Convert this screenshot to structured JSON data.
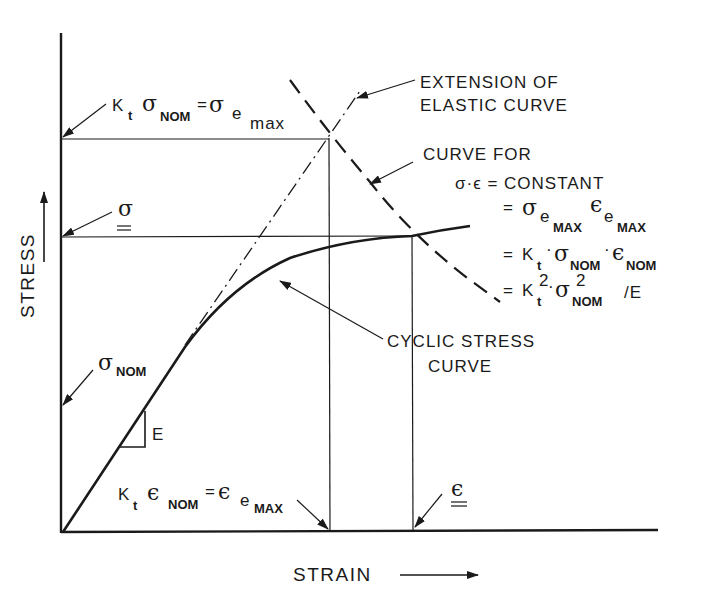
{
  "diagram": {
    "axes": {
      "x_label": "STRAIN",
      "y_label": "STRESS"
    },
    "labels": {
      "extension_line1": "EXTENSION OF",
      "extension_line2": "ELASTIC CURVE",
      "curve_for": "CURVE FOR",
      "eq1": "σ·ϵ = CONSTANT",
      "eq2_eq": "=",
      "eq3_eq": "=",
      "eq4_eq": "=",
      "cyclic_line1": "CYCLIC STRESS",
      "cyclic_line2": "CURVE",
      "slope_label": "E",
      "sigma_nom": "σ",
      "sigma_nom_sub": "NOM",
      "sigma_bar": "σ",
      "eps_bar": "ϵ",
      "kt_sigma_left": "K",
      "kt_sigma_t": "t",
      "kt_sigma_sig": "σ",
      "kt_sigma_nom": "NOM",
      "kt_sigma_eq": "=",
      "kt_sigma_rhs": "σ",
      "kt_sigma_e": "e",
      "kt_sigma_max": "max",
      "kt_eps_k": "K",
      "kt_eps_t": "t",
      "kt_eps_eps": "ϵ",
      "kt_eps_nom": "NOM",
      "kt_eps_eq": "=",
      "kt_eps_rhs": "ϵ",
      "kt_eps_e": "e",
      "kt_eps_max": "MAX",
      "eq2_sigma": "σ",
      "eq2_e1": "e",
      "eq2_max1": "MAX",
      "eq2_eps": "ϵ",
      "eq2_e2": "e",
      "eq2_max2": "MAX",
      "eq3_k": "K",
      "eq3_t": "t",
      "eq3_dot1": "·",
      "eq3_sigma": "σ",
      "eq3_nom1": "NOM",
      "eq3_dot2": "·",
      "eq3_eps": "ϵ",
      "eq3_nom2": "NOM",
      "eq4_k": "K",
      "eq4_t": "t",
      "eq4_sq1": "2",
      "eq4_dot": "·",
      "eq4_sigma": "σ",
      "eq4_sq2": "2",
      "eq4_nom": "NOM",
      "eq4_div": "/E"
    },
    "key_points": {
      "origin": [
        63,
        532
      ],
      "elastic_max_point": [
        329,
        138
      ],
      "cyclic_intersection": [
        412,
        236
      ]
    }
  }
}
